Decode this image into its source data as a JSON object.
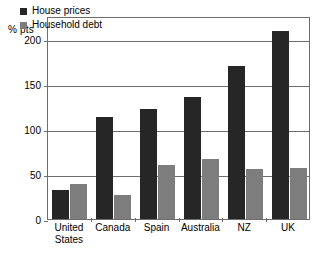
{
  "chart_data": {
    "type": "bar",
    "title": "",
    "subtitle": "",
    "xlabel": "",
    "ylabel": "% pts",
    "unit_label": "% pts",
    "categories": [
      "United States",
      "Canada",
      "Spain",
      "Australia",
      "NZ",
      "UK"
    ],
    "category_lines": [
      [
        "United",
        "States"
      ],
      [
        "Canada"
      ],
      [
        "Spain"
      ],
      [
        "Australia"
      ],
      [
        "NZ"
      ],
      [
        "UK"
      ]
    ],
    "series": [
      {
        "name": "House prices",
        "color": "#262626",
        "values": [
          32,
          113,
          122,
          135,
          170,
          208
        ]
      },
      {
        "name": "Household debt",
        "color": "#7d7d7d",
        "values": [
          39,
          27,
          60,
          66,
          55,
          57
        ]
      }
    ],
    "ylim": [
      0,
      225
    ],
    "yticks": [
      0,
      50,
      100,
      150,
      200
    ],
    "ytick_labels": [
      "0",
      "50",
      "100",
      "150",
      "200"
    ],
    "grid": true,
    "legend_position": "top-left"
  },
  "colors": {
    "house_prices": "#262626",
    "household_debt": "#7d7d7d",
    "axis": "#6d6d6d",
    "background": "#ffffff"
  }
}
